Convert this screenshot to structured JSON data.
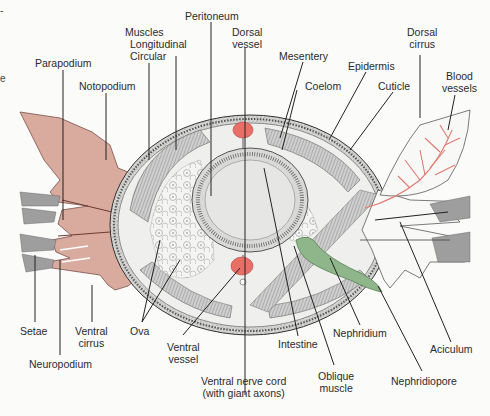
{
  "figure": {
    "colors": {
      "parapodium_fill": "#d9aa9e",
      "blood_red": "#e86e66",
      "nephridium_green": "#8fb58a",
      "line": "#222222",
      "tissue_gray": "#b9b9b9",
      "background": "#fbfbfa"
    }
  },
  "labels": {
    "peritoneum": "Peritoneum",
    "muscles": "Muscles",
    "longitudinal": "Longitudinal",
    "circular": "Circular",
    "dorsal_vessel": "Dorsal\nvessel",
    "mesentery": "Mesentery",
    "epidermis": "Epidermis",
    "dorsal_cirrus": "Dorsal\ncirrus",
    "coelom": "Coelom",
    "cuticle": "Cuticle",
    "blood_vessels": "Blood\nvessels",
    "parapodium": "Parapodium",
    "notopodium": "Notopodium",
    "setae": "Setae",
    "ventral_cirrus": "Ventral\ncirrus",
    "neuropodium": "Neuropodium",
    "ova": "Ova",
    "ventral_vessel": "Ventral\nvessel",
    "ventral_nerve_cord": "Ventral nerve cord\n(with giant axons)",
    "intestine": "Intestine",
    "oblique_muscle": "Oblique\nmuscle",
    "nephridium": "Nephridium",
    "nephridiopore": "Nephridiopore",
    "aciculum": "Aciculum"
  },
  "edge_fragments": [
    "-",
    "e"
  ]
}
